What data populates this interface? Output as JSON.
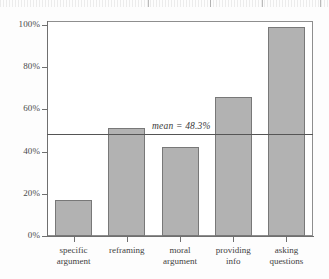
{
  "chart_data": {
    "type": "bar",
    "title": "",
    "subtitle": "",
    "xlabel": "",
    "ylabel": "",
    "categories": [
      "specific argument",
      "reframing",
      "moral argument",
      "providing info",
      "asking questions"
    ],
    "category_lines": [
      [
        "specific",
        "argument"
      ],
      [
        "reframing",
        ""
      ],
      [
        "moral",
        "argument"
      ],
      [
        "providing",
        "info"
      ],
      [
        "asking",
        "questions"
      ]
    ],
    "values": [
      17,
      51,
      42,
      66,
      99
    ],
    "ylim": [
      0,
      100
    ],
    "yticks": [
      0,
      20,
      40,
      60,
      80,
      100
    ],
    "ytick_labels": [
      "0%",
      "20%",
      "40%",
      "60%",
      "80%",
      "100%"
    ],
    "grid": false,
    "legend": "none",
    "annotations": [
      {
        "name": "mean-line",
        "label": "mean = 48.3%",
        "value": 48.3,
        "orientation": "horizontal"
      }
    ],
    "colors": {
      "bar_fill": "#b2b2b2",
      "bar_edge": "#787878",
      "axis": "#6f6f6f",
      "frame": "#8e8e8e",
      "mean_line": "#555555",
      "text": "#3f3f3f",
      "background": "#fdfdfd"
    }
  }
}
